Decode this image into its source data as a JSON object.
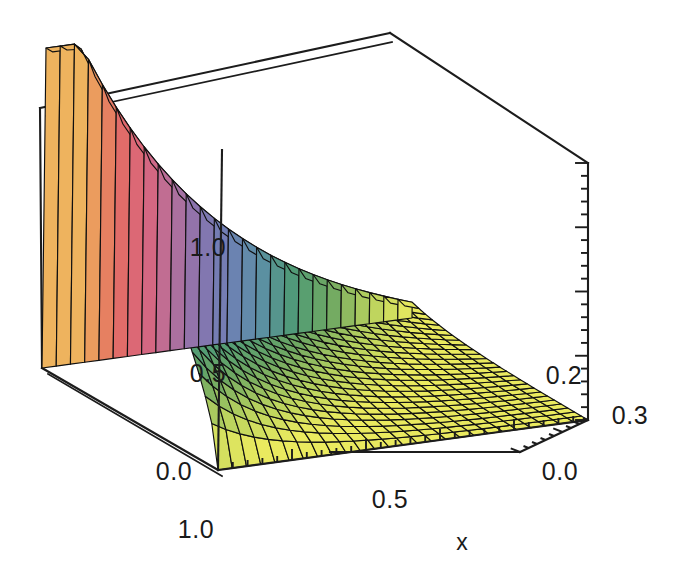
{
  "figure": {
    "kind": "surface-plot-3d",
    "background_color": "#ffffff",
    "frame_color": "#1c1c1c",
    "mesh_color": "#101010"
  },
  "chart_data": {
    "type": "surface",
    "title": "",
    "subtitle": "",
    "xlabel": "x",
    "ylabel": "",
    "zlabel": "",
    "grid": true,
    "legend": "none",
    "projection": "3d-box-frame",
    "axes": {
      "x": {
        "name": "x",
        "ticks": [
          "1.0",
          "0.5",
          "0.0"
        ],
        "tick_values": [
          1.0,
          0.5,
          0.0
        ],
        "range": [
          1.0,
          0.0
        ],
        "direction": "decreasing-left-to-right"
      },
      "y": {
        "name": "",
        "ticks": [
          "0.3",
          "0.2",
          "0.0"
        ],
        "tick_values": [
          0.3,
          0.2,
          0.0
        ],
        "range": [
          0.0,
          0.3
        ],
        "direction": "depth"
      },
      "z": {
        "name": "",
        "ticks": [
          "0.0",
          "0.5",
          "1.0"
        ],
        "tick_values": [
          0.0,
          0.5,
          1.0
        ],
        "range": [
          0.0,
          1.0
        ],
        "direction": "vertical"
      }
    },
    "surface": {
      "description": "Monotone decreasing sheet: high plateau along the back-left (x near 1, y near 0.3) falling steeply toward the front-right corner (x near 0, y near 0) where the value approaches zero.",
      "nx": 26,
      "ny": 26,
      "zmin": 0.0,
      "zmax": 1.0,
      "colormap": "rainbow",
      "colormap_stops": [
        "#eaea5f",
        "#b8d25e",
        "#6fa862",
        "#4f9a77",
        "#5d8fa6",
        "#6f7fb4",
        "#8a74ae",
        "#b86f9a",
        "#d9667e",
        "#e06a6a",
        "#e8875e",
        "#eeb35e"
      ]
    },
    "box": {
      "corner_back_left": [
        40,
        108
      ],
      "corner_back_top": [
        390,
        33
      ],
      "corner_right": [
        588,
        163
      ],
      "corner_front": [
        218,
        470
      ],
      "corner_bottom_left": [
        42,
        368
      ],
      "corner_bottom_right": [
        588,
        420
      ],
      "corner_bottom_front": [
        218,
        470
      ]
    },
    "tick_labels_positions": {
      "x_1_0": [
        225,
        528
      ],
      "x_0_5": [
        398,
        498
      ],
      "y_0_0": [
        560,
        440
      ],
      "y_0_2": [
        553,
        372
      ],
      "y_0_3": [
        620,
        404
      ],
      "z_0_0": [
        196,
        464
      ],
      "z_0_5": [
        206,
        372
      ],
      "z_1_0": [
        206,
        248
      ],
      "xlabel": [
        462,
        540
      ]
    }
  },
  "labels": {
    "x_axis_name": "x",
    "x_tick_1": "1.0",
    "x_tick_2": "0.5",
    "y_tick_0": "0.0",
    "y_tick_02": "0.2",
    "y_tick_03": "0.3",
    "z_tick_0": "0.0",
    "z_tick_05": "0.5",
    "z_tick_10": "1.0"
  }
}
